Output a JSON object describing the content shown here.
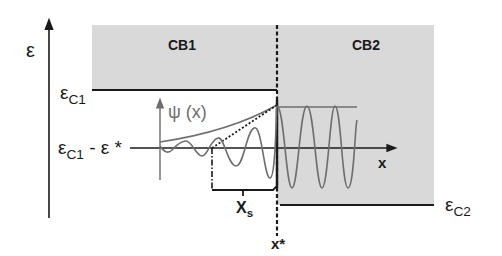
{
  "diagram": {
    "type": "band-diagram",
    "colors": {
      "band_fill": "#d9d9d9",
      "line": "#1a1a1a",
      "wave": "#6e6e6e"
    },
    "labels": {
      "energy_axis": "ε",
      "band1": "CB1",
      "band2": "CB2",
      "ec1_symbol": "ε",
      "ec1_sub": "C1",
      "ec2_symbol": "ε",
      "ec2_sub": "C2",
      "level_symbol": "ε",
      "level_sub": "C1",
      "level_rest": " - ε *",
      "psi": "ψ (x)",
      "x_axis": "x",
      "xs_symbol": "X",
      "xs_sub": "s",
      "xstar": "x*"
    }
  }
}
